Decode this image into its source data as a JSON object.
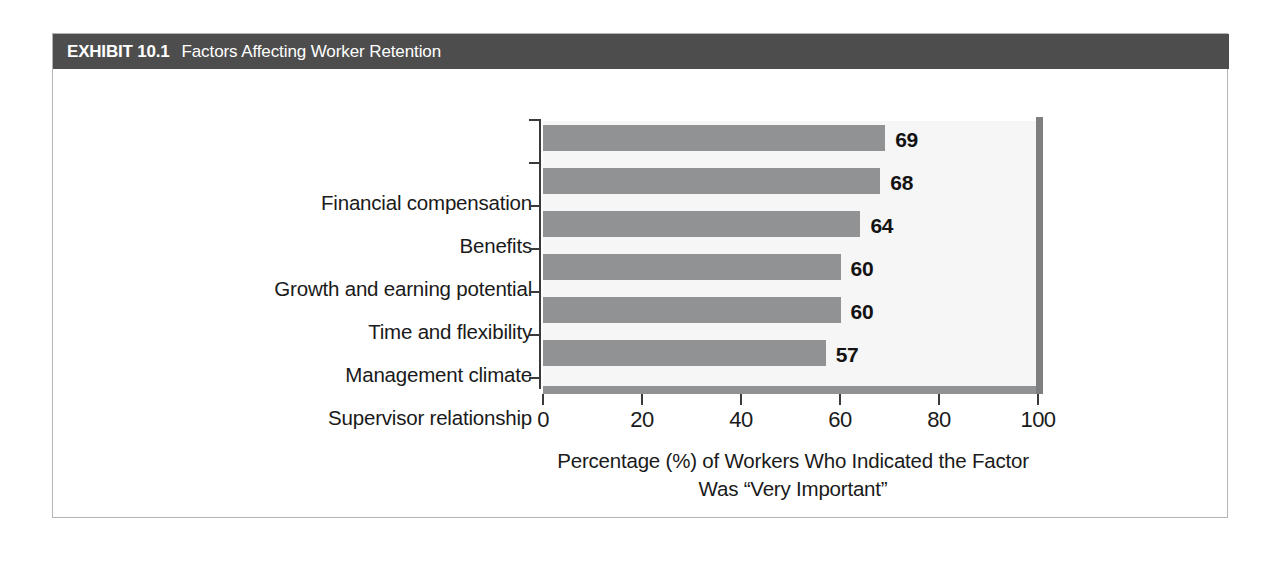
{
  "exhibit": {
    "number": "EXHIBIT 10.1",
    "title": "Factors Affecting Worker Retention"
  },
  "chart_data": {
    "type": "bar",
    "orientation": "horizontal",
    "title": "Factors Affecting Worker Retention",
    "categories": [
      "Financial compensation",
      "Benefits",
      "Growth and earning potential",
      "Time and flexibility",
      "Management climate",
      "Supervisor relationship"
    ],
    "values": [
      69,
      68,
      64,
      60,
      60,
      57
    ],
    "value_labels": [
      "69",
      "68",
      "64",
      "60",
      "60",
      "57"
    ],
    "xlabel_line1": "Percentage (%) of Workers Who Indicated the Factor",
    "xlabel_line2": "Was “Very Important”",
    "ylabel": "",
    "xlim": [
      0,
      100
    ],
    "xticks": [
      0,
      20,
      40,
      60,
      80,
      100
    ],
    "xtick_labels": [
      "0",
      "20",
      "40",
      "60",
      "80",
      "100"
    ],
    "grid": false,
    "legend": "none",
    "bar_color": "#919293",
    "plot_background": "#f6f6f6",
    "axis_color": "#3a3a3a",
    "header_background": "#4d4d4d",
    "header_text_color": "#ffffff"
  }
}
